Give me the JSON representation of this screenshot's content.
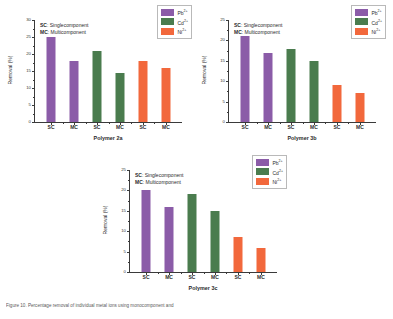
{
  "figure": {
    "caption": "Figure 10. Percentage removal of individual metal ions using monocomponent and",
    "colors": {
      "pb": "#8B5CA8",
      "cd": "#4A7C4E",
      "ni": "#F2683C",
      "axis": "#3a3a3a",
      "text": "#2b2b2b"
    },
    "legend": [
      {
        "name": "Pb2+",
        "label": "Pb",
        "charge": "2+",
        "color_key": "pb"
      },
      {
        "name": "Cd2+",
        "label": "Cd",
        "charge": "2+",
        "color_key": "cd"
      },
      {
        "name": "Ni2+",
        "label": "Ni",
        "charge": "2+",
        "color_key": "ni"
      }
    ],
    "notes": {
      "sc_key": "SC",
      "sc_text": ": Singlecomponent",
      "mc_key": "MC",
      "mc_text": ": Multicomponent"
    }
  },
  "chart_data": [
    {
      "type": "bar",
      "id": "polymer-2a",
      "title": "",
      "xlabel": "Polymer 2a",
      "ylabel": "Removal (%)",
      "ylim": [
        0,
        30
      ],
      "yticks": [
        0,
        5,
        10,
        15,
        20,
        25,
        30
      ],
      "ytick_labels": [
        "0",
        "5",
        "10",
        "15",
        "20",
        "25",
        "30"
      ],
      "grid": false,
      "legend_position": "top-right",
      "categories": [
        "SC",
        "MC",
        "SC",
        "MC",
        "SC",
        "MC"
      ],
      "series": [
        {
          "name": "Pb2+",
          "color_key": "pb",
          "indices": [
            0,
            1
          ],
          "values": [
            25.0,
            18.0
          ]
        },
        {
          "name": "Cd2+",
          "color_key": "cd",
          "indices": [
            2,
            3
          ],
          "values": [
            21.0,
            14.5
          ]
        },
        {
          "name": "Ni2+",
          "color_key": "ni",
          "indices": [
            4,
            5
          ],
          "values": [
            18.0,
            16.0
          ]
        }
      ],
      "values": [
        25.0,
        18.0,
        21.0,
        14.5,
        18.0,
        16.0
      ]
    },
    {
      "type": "bar",
      "id": "polymer-3b",
      "title": "",
      "xlabel": "Polymer 3b",
      "ylabel": "Removal (%)",
      "ylim": [
        0,
        25
      ],
      "yticks": [
        0,
        5,
        10,
        15,
        20,
        25
      ],
      "ytick_labels": [
        "0",
        "5",
        "10",
        "15",
        "20",
        "25"
      ],
      "grid": false,
      "legend_position": "top-right",
      "categories": [
        "SC",
        "MC",
        "SC",
        "MC",
        "SC",
        "MC"
      ],
      "series": [
        {
          "name": "Pb2+",
          "color_key": "pb",
          "indices": [
            0,
            1
          ],
          "values": [
            21.0,
            17.0
          ]
        },
        {
          "name": "Cd2+",
          "color_key": "cd",
          "indices": [
            2,
            3
          ],
          "values": [
            18.0,
            15.0
          ]
        },
        {
          "name": "Ni2+",
          "color_key": "ni",
          "indices": [
            4,
            5
          ],
          "values": [
            9.0,
            7.0
          ]
        }
      ],
      "values": [
        21.0,
        17.0,
        18.0,
        15.0,
        9.0,
        7.0
      ]
    },
    {
      "type": "bar",
      "id": "polymer-3c",
      "title": "",
      "xlabel": "Polymer 3c",
      "ylabel": "Removal (%)",
      "ylim": [
        0,
        25
      ],
      "yticks": [
        0,
        5,
        10,
        15,
        20,
        25
      ],
      "ytick_labels": [
        "0",
        "5",
        "10",
        "15",
        "20",
        "25"
      ],
      "grid": false,
      "legend_position": "top-right",
      "categories": [
        "SC",
        "MC",
        "SC",
        "MC",
        "SC",
        "MC"
      ],
      "series": [
        {
          "name": "Pb2+",
          "color_key": "pb",
          "indices": [
            0,
            1
          ],
          "values": [
            20.0,
            16.0
          ]
        },
        {
          "name": "Cd2+",
          "color_key": "cd",
          "indices": [
            2,
            3
          ],
          "values": [
            19.0,
            15.0
          ]
        },
        {
          "name": "Ni2+",
          "color_key": "ni",
          "indices": [
            4,
            5
          ],
          "values": [
            8.5,
            6.0
          ]
        }
      ],
      "values": [
        20.0,
        16.0,
        19.0,
        15.0,
        8.5,
        6.0
      ]
    }
  ]
}
